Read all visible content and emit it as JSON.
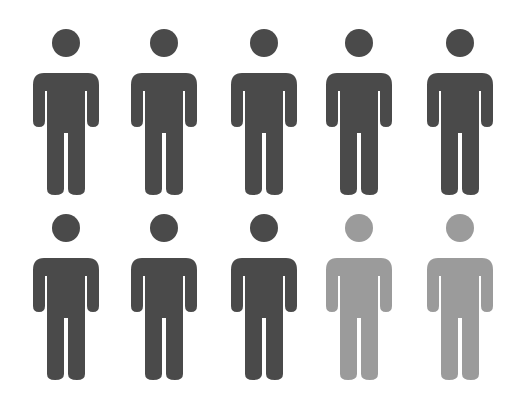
{
  "chart_data": {
    "type": "pictogram",
    "title": "",
    "total_icons": 10,
    "rows": 2,
    "columns": 5,
    "icon": "person-icon",
    "series": [
      {
        "name": "highlighted",
        "count": 8,
        "color": "#4a4a4a"
      },
      {
        "name": "remaining",
        "count": 2,
        "color": "#9b9b9b"
      }
    ],
    "values": [
      8,
      2
    ],
    "categories": [
      "highlighted",
      "remaining"
    ],
    "ratio_text": "8 out of 10"
  },
  "layout": {
    "column_centers": [
      66,
      164,
      264,
      359,
      460
    ],
    "row_tops": [
      29,
      214
    ]
  }
}
